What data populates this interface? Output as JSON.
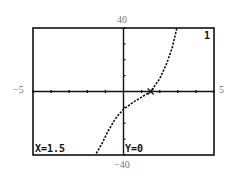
{
  "chart_data": {
    "type": "line",
    "title": "",
    "xlabel": "",
    "ylabel": "",
    "xlim": [
      -5,
      5
    ],
    "ylim": [
      -40,
      40
    ],
    "window_labels": {
      "ymax": "40",
      "ymin": "−40",
      "xmin": "−5",
      "xmax": "5"
    },
    "xscale": 1,
    "yscale": 10,
    "grid": false,
    "series": [
      {
        "name": "1",
        "style": "dotted",
        "points": [
          [
            -1.5,
            -39
          ],
          [
            -1.2,
            -33
          ],
          [
            -0.9,
            -26
          ],
          [
            -0.5,
            -18
          ],
          [
            -0.3,
            -15
          ],
          [
            0,
            -11.3
          ],
          [
            0.5,
            -7
          ],
          [
            1.0,
            -3.5
          ],
          [
            1.5,
            0
          ],
          [
            2.0,
            8
          ],
          [
            2.4,
            18
          ],
          [
            2.7,
            28
          ],
          [
            2.95,
            40
          ]
        ]
      }
    ],
    "trace_cursor": {
      "x": 1.5,
      "y": 0
    },
    "annotations": [
      "X=1.5",
      "Y=0",
      "1"
    ]
  },
  "screen": {
    "x_readout": "X=1.5",
    "y_readout": "Y=0",
    "equation_index": "1"
  }
}
